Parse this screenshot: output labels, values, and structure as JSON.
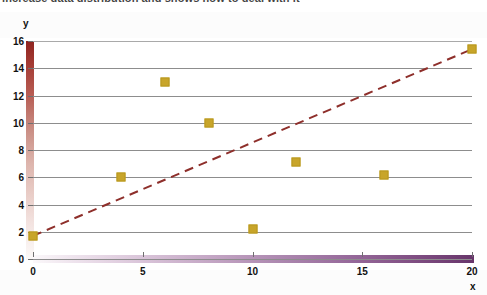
{
  "caption": {
    "text": "increase data distribution and shows how to deal with it"
  },
  "chart_data": {
    "type": "scatter",
    "title": "",
    "xlabel": "x",
    "ylabel": "y",
    "xlim": [
      0,
      20
    ],
    "ylim": [
      0,
      16
    ],
    "grid": true,
    "legend": "none",
    "x_ticks": [
      "0",
      "5",
      "10",
      "15",
      "20"
    ],
    "x_tick_values": [
      0,
      5,
      10,
      15,
      20
    ],
    "y_ticks": [
      "0",
      "2",
      "4",
      "6",
      "8",
      "10",
      "12",
      "14",
      "16"
    ],
    "y_tick_values": [
      0,
      2,
      4,
      6,
      8,
      10,
      12,
      14,
      16
    ],
    "series": [
      {
        "name": "data points",
        "marker": "square",
        "color": "#c8a52a",
        "points": [
          {
            "x": 0,
            "y": 1.7
          },
          {
            "x": 4,
            "y": 6.0
          },
          {
            "x": 6,
            "y": 13.0
          },
          {
            "x": 8,
            "y": 10.0
          },
          {
            "x": 10,
            "y": 2.2
          },
          {
            "x": 12,
            "y": 7.1
          },
          {
            "x": 16,
            "y": 6.2
          },
          {
            "x": 20,
            "y": 15.4
          }
        ]
      },
      {
        "name": "trendline",
        "marker": "none",
        "style": "dashed",
        "color": "#8e2f2b",
        "points": [
          {
            "x": 0,
            "y": 1.7
          },
          {
            "x": 20,
            "y": 15.4
          }
        ]
      }
    ]
  },
  "axes_style": {
    "y_axis_gradient_top": "#8f2420",
    "y_axis_gradient_bottom": "#fcf9f8",
    "x_axis_gradient_left": "#fbf8fa",
    "x_axis_gradient_right": "#67356a",
    "gridline_color": "#8d8d8d",
    "marker_color": "#c8a52a",
    "trendline_color": "#8e2f2b"
  }
}
